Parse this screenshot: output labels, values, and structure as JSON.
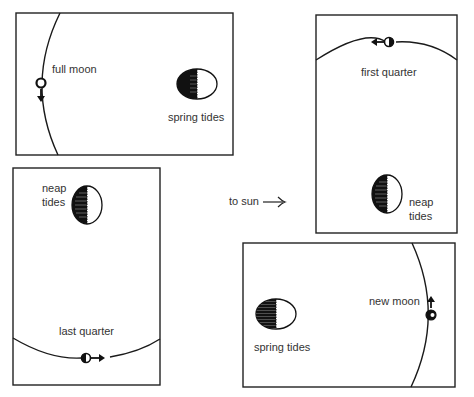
{
  "diagram": {
    "sun_direction_label": "to sun",
    "panels": [
      {
        "id": "full-moon",
        "phase_label": "full moon",
        "tide_label": "spring tides",
        "moon_motion": "down"
      },
      {
        "id": "first-quarter",
        "phase_label": "first quarter",
        "tide_label_line1": "neap",
        "tide_label_line2": "tides",
        "moon_motion": "left"
      },
      {
        "id": "last-quarter",
        "phase_label": "last quarter",
        "tide_label_line1": "neap",
        "tide_label_line2": "tides",
        "moon_motion": "right"
      },
      {
        "id": "new-moon",
        "phase_label": "new moon",
        "tide_label": "spring tides",
        "moon_motion": "up"
      }
    ],
    "colors": {
      "ink": "#1a1a1a",
      "label": "#333333",
      "background": "#ffffff"
    }
  }
}
